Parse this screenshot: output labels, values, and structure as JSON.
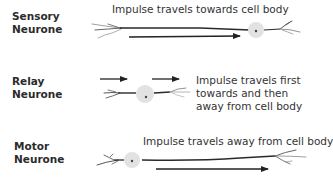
{
  "rows": [
    {
      "type": "sensory",
      "label_line1": "Sensory",
      "label_line2": "Neurone",
      "description": "Impulse travels towards cell body"
    },
    {
      "type": "relay",
      "label_line1": "Relay",
      "label_line2": "Neurone",
      "description_lines": [
        "Impulse travels first",
        "towards and then",
        "away from cell body"
      ]
    },
    {
      "type": "motor",
      "label_line1": "Motor",
      "label_line2": "Neurone",
      "description": "Impulse travels away from cell body"
    }
  ],
  "colors": {
    "axon": "#2a2a2a",
    "cell_body": "#e2e2e2",
    "nucleus": "#444444",
    "dendrite_light": "#9a9a9a",
    "arrow": "#222222"
  }
}
